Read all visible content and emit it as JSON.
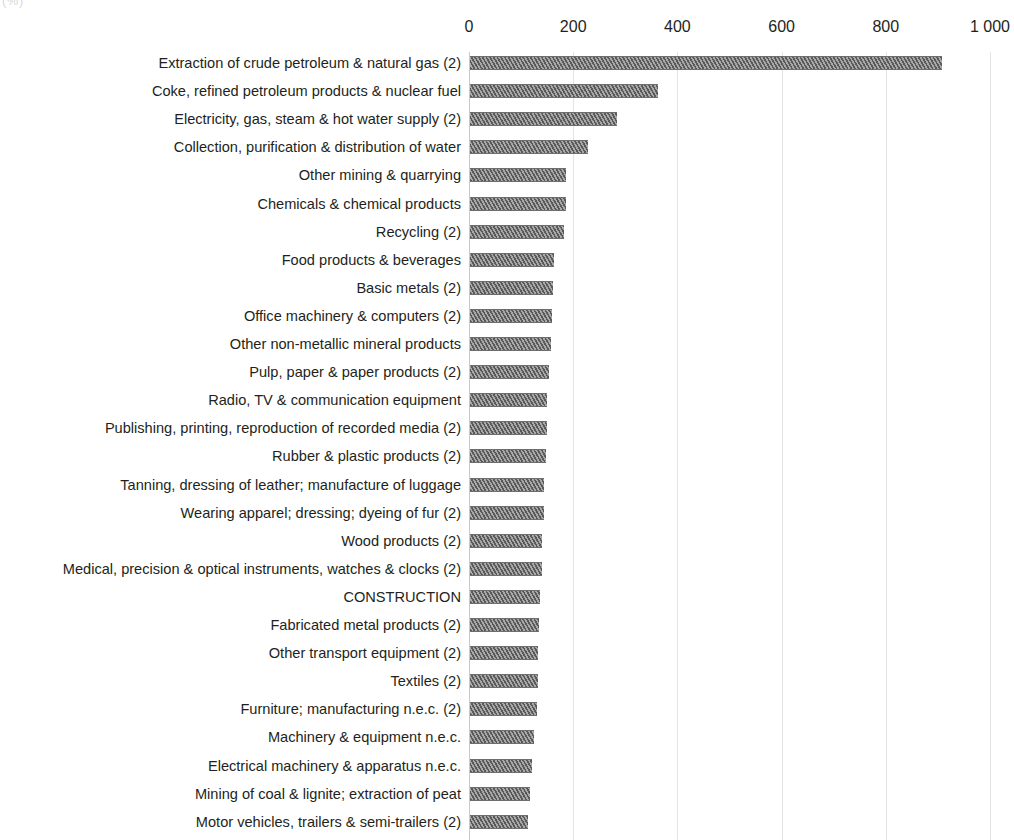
{
  "unit_label": "(%)",
  "chart_data": {
    "type": "bar",
    "orientation": "horizontal",
    "title": "",
    "subtitle": "",
    "xlabel": "",
    "ylabel": "",
    "unit": "(%)",
    "xlim": [
      0,
      1000
    ],
    "grid": true,
    "legend": "none",
    "axis_position": "top",
    "tick_labels": [
      "0",
      "200",
      "400",
      "600",
      "800",
      "1 000"
    ],
    "tick_values": [
      0,
      200,
      400,
      600,
      800,
      1000
    ],
    "categories": [
      "Extraction of crude petroleum & natural gas (2)",
      "Coke, refined petroleum products & nuclear fuel",
      "Electricity, gas, steam & hot water supply (2)",
      "Collection, purification & distribution of water",
      "Other mining & quarrying",
      "Chemicals & chemical products",
      "Recycling (2)",
      "Food products & beverages",
      "Basic metals (2)",
      "Office machinery & computers (2)",
      "Other non-metallic mineral products",
      "Pulp, paper & paper products (2)",
      "Radio, TV & communication equipment",
      "Publishing, printing, reproduction of recorded media (2)",
      "Rubber & plastic products (2)",
      "Tanning, dressing of leather; manufacture of luggage",
      "Wearing apparel; dressing; dyeing of fur (2)",
      "Wood products (2)",
      "Medical, precision & optical instruments, watches & clocks (2)",
      "CONSTRUCTION",
      "Fabricated metal products (2)",
      "Other transport equipment (2)",
      "Textiles (2)",
      "Furniture; manufacturing n.e.c. (2)",
      "Machinery & equipment n.e.c.",
      "Electrical machinery & apparatus n.e.c.",
      "Mining of coal & lignite; extraction of peat",
      "Motor vehicles, trailers & semi-trailers (2)"
    ],
    "values": [
      906,
      361,
      282,
      226,
      184,
      184,
      180,
      161,
      159,
      157,
      155,
      152,
      148,
      148,
      146,
      142,
      142,
      138,
      138,
      134,
      132,
      130,
      130,
      128,
      123,
      119,
      115,
      111
    ],
    "colors": {
      "bar_fill": "#8d8d8d",
      "bar_hatch": "#5a5a5a",
      "gridline": "#e4e4e6",
      "axis": "#c8c8cc",
      "text": "#231f20",
      "background": "#ffffff"
    }
  }
}
